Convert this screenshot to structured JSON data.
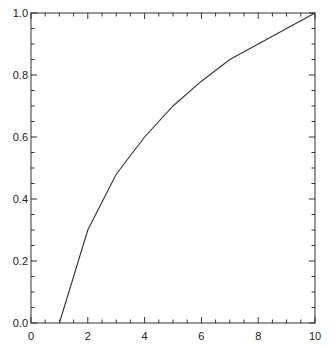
{
  "chart_data": {
    "type": "line",
    "title": "",
    "xlabel": "",
    "ylabel": "",
    "xlim": [
      0,
      10
    ],
    "ylim": [
      0.0,
      1.0
    ],
    "grid": false,
    "legend": null,
    "frame": "box",
    "tick_direction": "in",
    "x_ticks": {
      "major": [
        0,
        2,
        4,
        6,
        8,
        10
      ],
      "major_labels": [
        "0",
        "2",
        "4",
        "6",
        "8",
        "10"
      ],
      "minor_step": 0.5
    },
    "y_ticks": {
      "major": [
        0.0,
        0.2,
        0.4,
        0.6,
        0.8,
        1.0
      ],
      "major_labels": [
        "0.0",
        "0.2",
        "0.4",
        "0.6",
        "0.8",
        "1.0"
      ],
      "minor_step": 0.05
    },
    "series": [
      {
        "name": "curve",
        "color": "#333333",
        "x": [
          1,
          2,
          3,
          4,
          5,
          6,
          7,
          8,
          9,
          10
        ],
        "values": [
          0.0,
          0.3,
          0.48,
          0.6,
          0.7,
          0.78,
          0.85,
          0.9,
          0.95,
          1.0
        ]
      }
    ]
  },
  "style": {
    "axis_color": "#333333",
    "line_color": "#333333",
    "background": "#ffffff"
  }
}
